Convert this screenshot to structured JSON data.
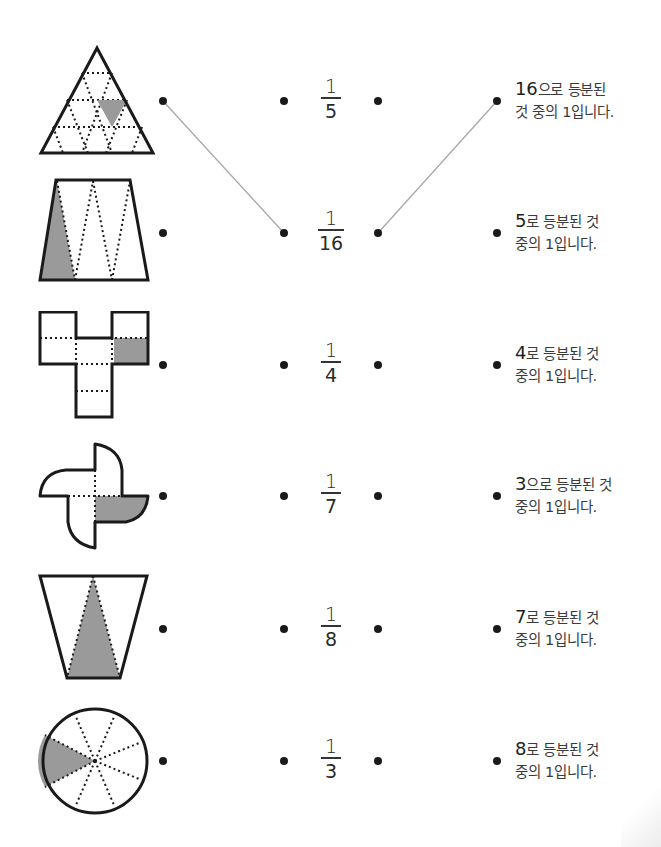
{
  "worksheet": {
    "type": "matching-exercise",
    "topic": "fractions-unit-fraction",
    "colors": {
      "shade": "#9a9a9a",
      "line": "#a8a8a8",
      "ink": "#1a1a1a"
    },
    "rows": [
      {
        "shape": "triangle-16-parts",
        "fraction": {
          "numerator": "1",
          "denominator": "5"
        },
        "description": {
          "lead": "16",
          "line1_rest": "으로 등분된",
          "line2": "것 중의 1입니다."
        }
      },
      {
        "shape": "trapezoid-5-parts",
        "fraction": {
          "numerator": "1",
          "denominator": "16"
        },
        "description": {
          "lead": "5",
          "line1_rest": "로 등분된 것",
          "line2": "중의 1입니다."
        }
      },
      {
        "shape": "cross-net-7-parts",
        "fraction": {
          "numerator": "1",
          "denominator": "4"
        },
        "description": {
          "lead": "4",
          "line1_rest": "로 등분된 것",
          "line2": "중의 1입니다."
        }
      },
      {
        "shape": "pinwheel-4-parts",
        "fraction": {
          "numerator": "1",
          "denominator": "7"
        },
        "description": {
          "lead": "3",
          "line1_rest": "으로 등분된 것",
          "line2": "중의 1입니다."
        }
      },
      {
        "shape": "inverted-trapezoid-3-parts",
        "fraction": {
          "numerator": "1",
          "denominator": "8"
        },
        "description": {
          "lead": "7",
          "line1_rest": "로 등분된 것",
          "line2": "중의 1입니다."
        }
      },
      {
        "shape": "circle-8-parts",
        "fraction": {
          "numerator": "1",
          "denominator": "3"
        },
        "description": {
          "lead": "8",
          "line1_rest": "로 등분된 것",
          "line2": "중의 1입니다."
        }
      }
    ],
    "connections": [
      {
        "from": "shape-row-1",
        "to": "fraction-row-2",
        "label": "1/16"
      },
      {
        "from": "fraction-row-2",
        "to": "description-row-1",
        "label": "16으로 등분된 것 중의 1"
      }
    ]
  }
}
